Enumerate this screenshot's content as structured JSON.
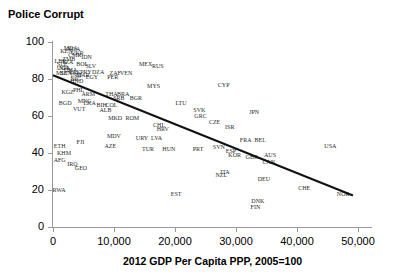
{
  "chart_data": {
    "type": "scatter",
    "title": "Police Corrupt",
    "xlabel": "2012 GDP Per Capita PPP, 2005=100",
    "ylabel": "",
    "xlim": [
      0,
      52000
    ],
    "ylim": [
      0,
      100
    ],
    "xticks": [
      0,
      10000,
      20000,
      30000,
      40000,
      50000
    ],
    "xtick_labels": [
      "0",
      "10,000",
      "20,000",
      "30,000",
      "40,000",
      "50,000"
    ],
    "yticks": [
      0,
      20,
      40,
      60,
      80,
      100
    ],
    "ytick_labels": [
      "0",
      "20",
      "40",
      "60",
      "80",
      "100"
    ],
    "grid": false,
    "legend": null,
    "point_label_style": "iso3-country-code",
    "trend_line": {
      "visible": true,
      "x_start": 0,
      "y_start": 82,
      "x_end": 49200,
      "y_end": 17,
      "color": "#111111"
    },
    "points": [
      {
        "label": "MDA",
        "x": 2900,
        "y": 97
      },
      {
        "label": "NGA",
        "x": 3400,
        "y": 96
      },
      {
        "label": "KEN",
        "x": 2200,
        "y": 95
      },
      {
        "label": "UKR",
        "x": 4000,
        "y": 94
      },
      {
        "label": "CMR",
        "x": 3600,
        "y": 93
      },
      {
        "label": "IDN",
        "x": 5500,
        "y": 92
      },
      {
        "label": "ZMB",
        "x": 2600,
        "y": 91
      },
      {
        "label": "LBR",
        "x": 1200,
        "y": 90
      },
      {
        "label": "TZA",
        "x": 2400,
        "y": 89
      },
      {
        "label": "SLE",
        "x": 1500,
        "y": 88
      },
      {
        "label": "BOL",
        "x": 4800,
        "y": 88
      },
      {
        "label": "SLV",
        "x": 6200,
        "y": 87
      },
      {
        "label": "NPL",
        "x": 1900,
        "y": 86
      },
      {
        "label": "UGA",
        "x": 1700,
        "y": 86
      },
      {
        "label": "GHA",
        "x": 2900,
        "y": 85
      },
      {
        "label": "PAK",
        "x": 3600,
        "y": 84
      },
      {
        "label": "PRY",
        "x": 5400,
        "y": 84
      },
      {
        "label": "DZA",
        "x": 7400,
        "y": 84
      },
      {
        "label": "SEN",
        "x": 2100,
        "y": 83
      },
      {
        "label": "MLI",
        "x": 1400,
        "y": 83
      },
      {
        "label": "ZAF",
        "x": 10200,
        "y": 83
      },
      {
        "label": "VEN",
        "x": 12000,
        "y": 83
      },
      {
        "label": "MEX",
        "x": 15200,
        "y": 88
      },
      {
        "label": "RUS",
        "x": 17200,
        "y": 87
      },
      {
        "label": "PER",
        "x": 9800,
        "y": 81
      },
      {
        "label": "IND",
        "x": 3800,
        "y": 82
      },
      {
        "label": "MAR",
        "x": 4900,
        "y": 82
      },
      {
        "label": "EGY",
        "x": 6400,
        "y": 81
      },
      {
        "label": "NIC",
        "x": 3700,
        "y": 80
      },
      {
        "label": "HND",
        "x": 3900,
        "y": 79
      },
      {
        "label": "MYS",
        "x": 16500,
        "y": 76
      },
      {
        "label": "CYP",
        "x": 28000,
        "y": 77
      },
      {
        "label": "PHL",
        "x": 4200,
        "y": 74
      },
      {
        "label": "KGZ",
        "x": 2400,
        "y": 73
      },
      {
        "label": "ARM",
        "x": 5800,
        "y": 72
      },
      {
        "label": "THA",
        "x": 9600,
        "y": 72
      },
      {
        "label": "BRA",
        "x": 11500,
        "y": 72
      },
      {
        "label": "SRB",
        "x": 10800,
        "y": 70
      },
      {
        "label": "BGR",
        "x": 13600,
        "y": 70
      },
      {
        "label": "MNG",
        "x": 5200,
        "y": 68
      },
      {
        "label": "BGD",
        "x": 2000,
        "y": 67
      },
      {
        "label": "LKA",
        "x": 6000,
        "y": 67
      },
      {
        "label": "BIH",
        "x": 8000,
        "y": 66
      },
      {
        "label": "COL",
        "x": 9600,
        "y": 66
      },
      {
        "label": "VUT",
        "x": 4300,
        "y": 64
      },
      {
        "label": "ALB",
        "x": 8600,
        "y": 63
      },
      {
        "label": "LTU",
        "x": 21000,
        "y": 67
      },
      {
        "label": "MKD",
        "x": 10200,
        "y": 59
      },
      {
        "label": "ROM",
        "x": 13000,
        "y": 59
      },
      {
        "label": "SVK",
        "x": 24000,
        "y": 63
      },
      {
        "label": "GRC",
        "x": 24200,
        "y": 60
      },
      {
        "label": "CZE",
        "x": 26500,
        "y": 57
      },
      {
        "label": "CHL",
        "x": 17400,
        "y": 55
      },
      {
        "label": "HRV",
        "x": 18000,
        "y": 53
      },
      {
        "label": "JPN",
        "x": 33000,
        "y": 62
      },
      {
        "label": "ISR",
        "x": 29000,
        "y": 54
      },
      {
        "label": "MDV",
        "x": 10000,
        "y": 49
      },
      {
        "label": "URY",
        "x": 14600,
        "y": 48
      },
      {
        "label": "LVA",
        "x": 17000,
        "y": 48
      },
      {
        "label": "ETH",
        "x": 1100,
        "y": 44
      },
      {
        "label": "FJI",
        "x": 4500,
        "y": 46
      },
      {
        "label": "AZE",
        "x": 9400,
        "y": 44
      },
      {
        "label": "TUR",
        "x": 15600,
        "y": 42
      },
      {
        "label": "HUN",
        "x": 19000,
        "y": 42
      },
      {
        "label": "PRT",
        "x": 23800,
        "y": 42
      },
      {
        "label": "SVN",
        "x": 27200,
        "y": 43
      },
      {
        "label": "ESP",
        "x": 29200,
        "y": 41
      },
      {
        "label": "KOR",
        "x": 29800,
        "y": 39
      },
      {
        "label": "FRA",
        "x": 31600,
        "y": 47
      },
      {
        "label": "BEL",
        "x": 34000,
        "y": 47
      },
      {
        "label": "GBR",
        "x": 32600,
        "y": 38
      },
      {
        "label": "AUS",
        "x": 35600,
        "y": 39
      },
      {
        "label": "CAN",
        "x": 35400,
        "y": 35
      },
      {
        "label": "USA",
        "x": 45500,
        "y": 44
      },
      {
        "label": "KHM",
        "x": 1800,
        "y": 40
      },
      {
        "label": "AFG",
        "x": 1100,
        "y": 36
      },
      {
        "label": "IRQ",
        "x": 3200,
        "y": 34
      },
      {
        "label": "GEO",
        "x": 4600,
        "y": 32
      },
      {
        "label": "ITA",
        "x": 28200,
        "y": 30
      },
      {
        "label": "NZL",
        "x": 27600,
        "y": 28
      },
      {
        "label": "DEU",
        "x": 34600,
        "y": 26
      },
      {
        "label": "CHE",
        "x": 41200,
        "y": 21
      },
      {
        "label": "NOR",
        "x": 47600,
        "y": 18
      },
      {
        "label": "RWA",
        "x": 1000,
        "y": 20
      },
      {
        "label": "EST",
        "x": 20200,
        "y": 18
      },
      {
        "label": "DNK",
        "x": 33600,
        "y": 14
      },
      {
        "label": "FIN",
        "x": 33200,
        "y": 11
      }
    ]
  }
}
